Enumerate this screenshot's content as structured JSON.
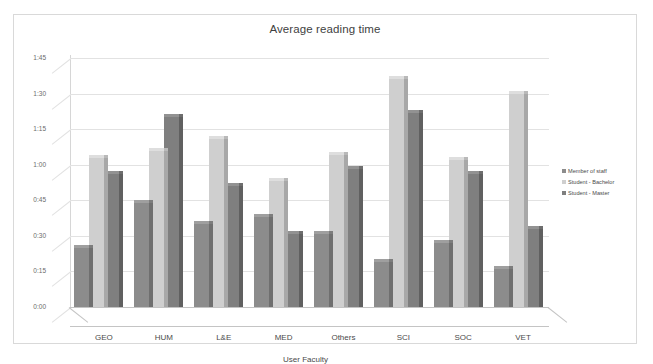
{
  "chart_data": {
    "type": "bar",
    "title": "Average reading time",
    "xlabel": "User Faculty",
    "ylabel": "",
    "categories": [
      "GEO",
      "HUM",
      "L&E",
      "MED",
      "Others",
      "SCI",
      "SOC",
      "VET"
    ],
    "ytick_labels": [
      "0:00",
      "0:15",
      "0:30",
      "0:45",
      "1:00",
      "1:15",
      "1:30",
      "1:45"
    ],
    "ytick_minutes": [
      0,
      15,
      30,
      45,
      60,
      75,
      90,
      105
    ],
    "ylim_minutes": [
      0,
      105
    ],
    "grid": true,
    "legend_position": "right",
    "series": [
      {
        "name": "Member of staff",
        "color": "#8c8c8c",
        "values_label": [
          "0:25",
          "0:44",
          "0:35",
          "0:38",
          "0:31",
          "0:19",
          "0:27",
          "0:16"
        ],
        "values": [
          25,
          44,
          35,
          38,
          31,
          19,
          27,
          16
        ]
      },
      {
        "name": "Student - Bachelor",
        "color": "#cfcfcf",
        "values_label": [
          "1:03",
          "1:06",
          "1:11",
          "0:53",
          "1:04",
          "1:36",
          "1:02",
          "1:30"
        ],
        "values": [
          63,
          66,
          71,
          53,
          64,
          96,
          62,
          90
        ]
      },
      {
        "name": "Student - Master",
        "color": "#7f7f7f",
        "values_label": [
          "0:56",
          "1:20",
          "0:51",
          "0:31",
          "0:58",
          "1:22",
          "0:56",
          "0:33"
        ],
        "values": [
          56,
          80,
          51,
          31,
          58,
          82,
          56,
          33
        ]
      }
    ]
  }
}
